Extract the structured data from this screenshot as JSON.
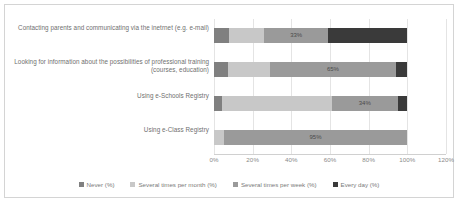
{
  "chart_data": {
    "type": "bar",
    "orientation": "horizontal",
    "stacked": true,
    "stack_mode": "percent",
    "title": "",
    "xlabel": "",
    "ylabel": "",
    "xlim": [
      0,
      120
    ],
    "grid": true,
    "legend_position": "bottom",
    "xtick_labels": [
      "0%",
      "20%",
      "40%",
      "60%",
      "80%",
      "100%",
      "120%"
    ],
    "xtick_values": [
      0,
      20,
      40,
      60,
      80,
      100,
      120
    ],
    "categories": [
      "Contacting parents and communicating via the inetrnet (e.g. e-mail)",
      "Looking for information about the possibilities of professional training (courses, education)",
      "Using e-Schools Registry",
      "Using e-Class Registry"
    ],
    "series": [
      {
        "name": "Never (%)",
        "color": "#808080",
        "values": [
          8,
          7,
          4,
          0
        ]
      },
      {
        "name": "Several times per month (%)",
        "color": "#c8c8c8",
        "values": [
          18,
          22,
          57,
          5
        ]
      },
      {
        "name": "Several times per week (%)",
        "color": "#9a9a9a",
        "values": [
          33,
          65,
          34,
          95
        ]
      },
      {
        "name": "Every day (%)",
        "color": "#3a3a3a",
        "values": [
          41,
          6,
          5,
          0
        ]
      }
    ],
    "data_labels": [
      {
        "category_index": 0,
        "series_index": 2,
        "text": "33%"
      },
      {
        "category_index": 1,
        "series_index": 2,
        "text": "65%"
      },
      {
        "category_index": 2,
        "series_index": 2,
        "text": "34%"
      },
      {
        "category_index": 3,
        "series_index": 2,
        "text": "95%"
      }
    ]
  }
}
